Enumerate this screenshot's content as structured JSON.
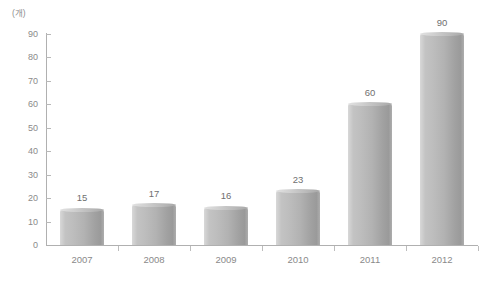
{
  "chart_data": {
    "type": "bar",
    "title": "",
    "xlabel": "",
    "ylabel": "",
    "unit_label": "(개)",
    "categories": [
      "2007",
      "2008",
      "2009",
      "2010",
      "2011",
      "2012"
    ],
    "values": [
      15,
      17,
      16,
      23,
      60,
      90
    ],
    "value_labels": [
      "15",
      "17",
      "16",
      "23",
      "60",
      "90"
    ],
    "ylim": [
      0,
      90
    ],
    "ytick_step": 10,
    "yticks": [
      0,
      10,
      20,
      30,
      40,
      50,
      60,
      70,
      80,
      90
    ],
    "ytick_labels": [
      "0",
      "10",
      "20",
      "30",
      "40",
      "50",
      "60",
      "70",
      "80",
      "90"
    ],
    "grid": false,
    "legend": null,
    "series": [
      {
        "name": "count",
        "values": [
          15,
          17,
          16,
          23,
          60,
          90
        ]
      }
    ],
    "colors": {
      "bar_light": "#d8d8d8",
      "bar_mid": "#bdbdbd",
      "bar_dark": "#9a9a9a",
      "axis": "#b0b0b0",
      "text": "#8a8a8a",
      "value_text": "#6f6f6f",
      "background": "#ffffff"
    }
  }
}
